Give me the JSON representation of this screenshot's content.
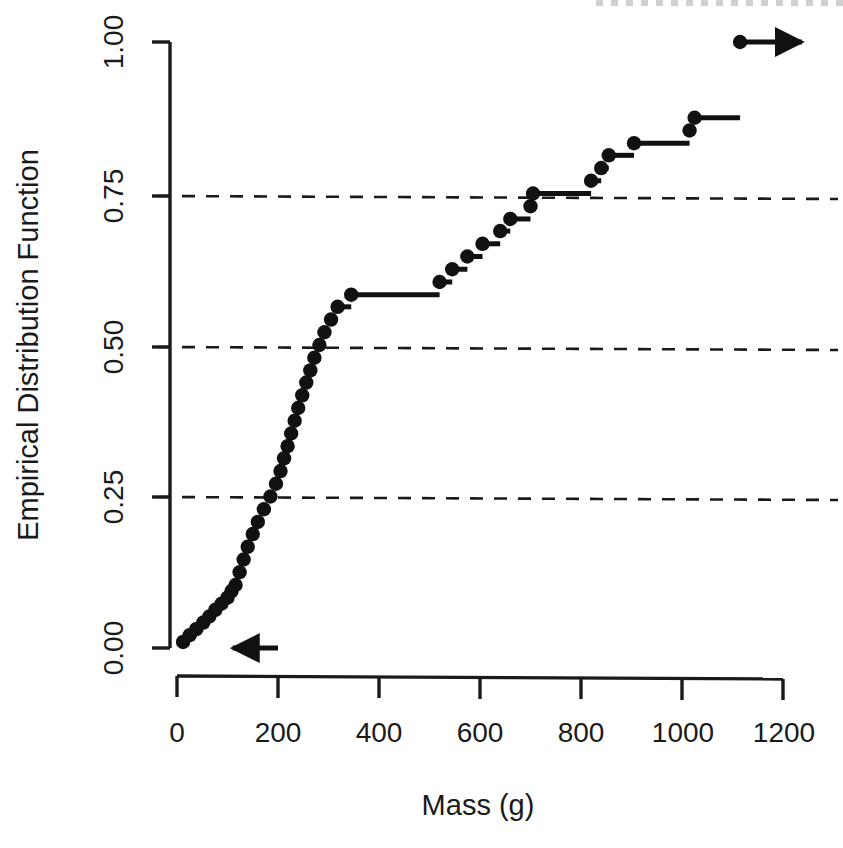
{
  "chart_data": {
    "type": "line",
    "subtype": "ecdf-step",
    "title": "",
    "xlabel": "Mass (g)",
    "ylabel": "Empirical Distribution Function",
    "xlim": [
      -40,
      1260
    ],
    "ylim": [
      0.0,
      1.0
    ],
    "xticks": [
      0,
      200,
      400,
      600,
      800,
      1000,
      1200
    ],
    "xtick_labels": [
      "0",
      "200",
      "400",
      "600",
      "800",
      "1000",
      "1200"
    ],
    "yticks": [
      0.0,
      0.25,
      0.5,
      0.75,
      1.0
    ],
    "ytick_labels": [
      "0.00",
      "0.25",
      "0.50",
      "0.75",
      "1.00"
    ],
    "grid": false,
    "reference_lines": [
      {
        "axis": "y",
        "value": 0.25,
        "style": "dashed"
      },
      {
        "axis": "y",
        "value": 0.5,
        "style": "dashed"
      },
      {
        "axis": "y",
        "value": 0.75,
        "style": "dashed"
      }
    ],
    "legend": null,
    "marker": "filled-circle",
    "line_color": "#111111",
    "x": [
      12,
      25,
      38,
      52,
      64,
      76,
      88,
      100,
      108,
      116,
      124,
      132,
      140,
      150,
      160,
      172,
      185,
      196,
      205,
      212,
      219,
      226,
      233,
      240,
      248,
      256,
      264,
      272,
      282,
      292,
      305,
      318,
      345,
      520,
      545,
      575,
      605,
      640,
      660,
      700,
      705,
      820,
      840,
      855,
      905,
      1015,
      1025,
      1115
    ],
    "values": [
      0.01,
      0.021,
      0.031,
      0.042,
      0.052,
      0.063,
      0.073,
      0.083,
      0.094,
      0.104,
      0.125,
      0.146,
      0.167,
      0.188,
      0.208,
      0.229,
      0.25,
      0.271,
      0.292,
      0.313,
      0.333,
      0.354,
      0.375,
      0.396,
      0.417,
      0.438,
      0.458,
      0.479,
      0.5,
      0.521,
      0.542,
      0.563,
      0.583,
      0.604,
      0.625,
      0.646,
      0.667,
      0.688,
      0.708,
      0.729,
      0.75,
      0.771,
      0.792,
      0.813,
      0.833,
      0.854,
      0.875,
      1.0
    ],
    "left_arrow": {
      "from_x": 200,
      "to_x": 150,
      "y": 0.0
    },
    "right_arrow": {
      "from_x": 1120,
      "to_x": 1265,
      "y": 1.0
    },
    "n_observations": 48
  },
  "axes": {
    "x_label": "Mass (g)",
    "y_label": "Empirical Distribution Function"
  }
}
